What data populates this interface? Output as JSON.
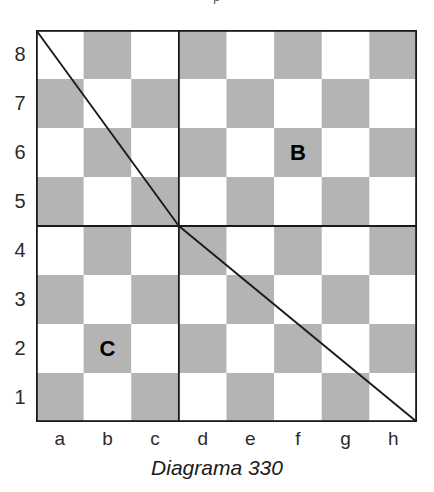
{
  "page": {
    "header_fragment": "p",
    "caption": "Diagrama 330",
    "background_color": "#ffffff"
  },
  "board": {
    "light_square_color": "#ffffff",
    "dark_square_color": "#b4b4b4",
    "border_color": "#1a1a1a",
    "line_color": "#1a1a1a",
    "files": [
      "a",
      "b",
      "c",
      "d",
      "e",
      "f",
      "g",
      "h"
    ],
    "ranks": [
      "8",
      "7",
      "6",
      "5",
      "4",
      "3",
      "2",
      "1"
    ],
    "size": 8,
    "first_square_light": true,
    "markers": [
      {
        "label": "B",
        "file": "f",
        "rank": "6",
        "file_index": 5,
        "rank_index": 2,
        "square_shade": "dark"
      },
      {
        "label": "C",
        "file": "b",
        "rank": "2",
        "file_index": 1,
        "rank_index": 6,
        "square_shade": "dark"
      }
    ],
    "quadrant_dividers": [
      {
        "name": "vertical-divider",
        "orientation": "vertical",
        "at_file_boundary": 3
      },
      {
        "name": "horizontal-divider",
        "orientation": "horizontal",
        "at_rank_boundary": 4
      }
    ],
    "diagonals": [
      {
        "name": "diagonal-upper-left",
        "from": {
          "file_index": 0,
          "rank_index": 0
        },
        "to": {
          "file_index": 3,
          "rank_index": 4
        }
      },
      {
        "name": "diagonal-lower-right",
        "from": {
          "file_index": 3,
          "rank_index": 4
        },
        "to": {
          "file_index": 8,
          "rank_index": 8
        }
      }
    ]
  },
  "chart_data": {
    "type": "diagram",
    "title": "Diagrama 330",
    "subtype": "chessboard",
    "grid": {
      "cols": 8,
      "rows": 8
    },
    "xlabel": "",
    "ylabel": "",
    "x_ticks": [
      "a",
      "b",
      "c",
      "d",
      "e",
      "f",
      "g",
      "h"
    ],
    "y_ticks": [
      "8",
      "7",
      "6",
      "5",
      "4",
      "3",
      "2",
      "1"
    ],
    "annotations": [
      {
        "text": "B",
        "square": "f6"
      },
      {
        "text": "C",
        "square": "b2"
      }
    ],
    "lines": [
      {
        "name": "diagonal-upper-left",
        "points": [
          [
            0,
            8
          ],
          [
            3,
            4
          ]
        ],
        "note": "from a8 corner to c/d - 4/5 intersection"
      },
      {
        "name": "diagonal-lower-right",
        "points": [
          [
            3,
            4
          ],
          [
            8,
            0
          ]
        ],
        "note": "from c/d - 4/5 intersection to h1 corner"
      },
      {
        "name": "vertical-divider",
        "points": [
          [
            3,
            8
          ],
          [
            3,
            0
          ]
        ]
      },
      {
        "name": "horizontal-divider",
        "points": [
          [
            0,
            4
          ],
          [
            8,
            4
          ]
        ]
      }
    ],
    "legend": []
  }
}
